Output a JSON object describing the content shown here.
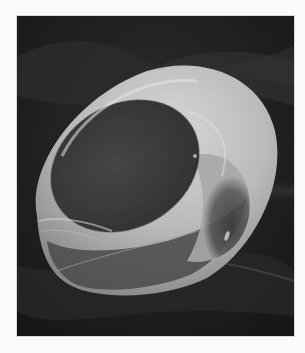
{
  "image": {
    "subject": "scanning electron micrograph of a cup-shaped red blood cell",
    "style": "grayscale",
    "colors": {
      "page_background": "#fbfbfb",
      "photo_background": "#1e1e1e",
      "cell_rim": "#c9c9c9",
      "cell_cavity": "#3e3e3e"
    }
  }
}
